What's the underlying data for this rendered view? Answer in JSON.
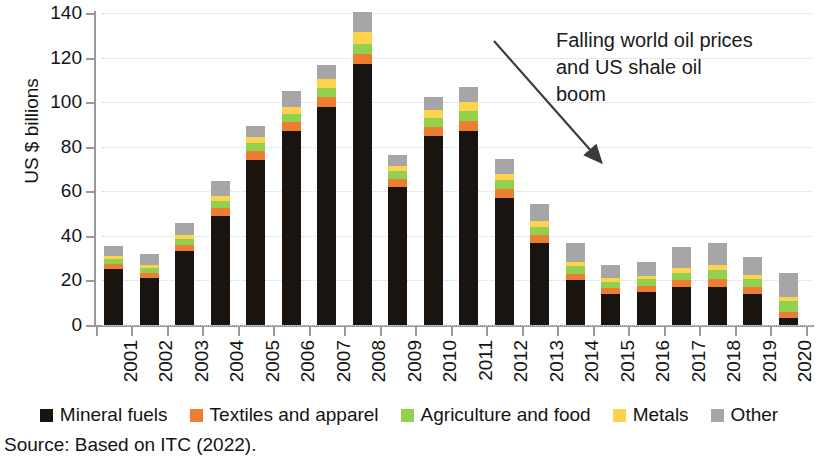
{
  "chart_data": {
    "type": "bar",
    "stacked": true,
    "title": "",
    "subtitle": "",
    "xlabel": "",
    "ylabel": "US $ billions",
    "ylim": [
      0,
      140
    ],
    "ytick_step": 20,
    "yticks": [
      "0",
      "20",
      "40",
      "60",
      "80",
      "100",
      "120",
      "140"
    ],
    "grid": true,
    "legend_position": "bottom",
    "categories": [
      "2001",
      "2002",
      "2003",
      "2004",
      "2005",
      "2006",
      "2007",
      "2008",
      "2009",
      "2010",
      "2011",
      "2012",
      "2013",
      "2014",
      "2015",
      "2016",
      "2017",
      "2018",
      "2019",
      "2020"
    ],
    "series": [
      {
        "name": "Mineral fuels",
        "color": "#1a1410",
        "values": [
          25,
          21,
          33,
          49,
          74,
          87,
          98,
          117,
          62,
          85,
          87,
          57,
          37,
          20,
          14,
          15,
          17,
          17,
          14,
          3
        ]
      },
      {
        "name": "Textiles and apparel",
        "color": "#ED7D31",
        "values": [
          2.5,
          2.5,
          3,
          3.5,
          4,
          4,
          4.5,
          4.5,
          3.5,
          4,
          4.5,
          4,
          3.5,
          3,
          2.5,
          2.5,
          3,
          3.5,
          3,
          3
        ]
      },
      {
        "name": "Agriculture and food",
        "color": "#92D050",
        "values": [
          2,
          2,
          2.5,
          3,
          3.5,
          3.5,
          4,
          4.5,
          3.5,
          4,
          4.5,
          4,
          3.5,
          3.5,
          3,
          3,
          3.5,
          4,
          3.5,
          5
        ]
      },
      {
        "name": "Metals",
        "color": "#FFD24D",
        "values": [
          1.5,
          1.5,
          2,
          2.5,
          3,
          3.5,
          4,
          5.5,
          2.5,
          3.5,
          4,
          3,
          2.5,
          2,
          1.5,
          1.5,
          2,
          2.5,
          2,
          1.5
        ]
      },
      {
        "name": "Other",
        "color": "#A6A6A6",
        "values": [
          4.5,
          5,
          5.5,
          6.5,
          5,
          7,
          6,
          9,
          5,
          6,
          7,
          6.5,
          8,
          8.5,
          6,
          6.5,
          9.5,
          10,
          8,
          11
        ]
      }
    ],
    "totals": [
      35.5,
      32,
      46,
      64.5,
      89.5,
      105,
      116.5,
      140.5,
      76.5,
      102.5,
      107,
      74.5,
      54.5,
      37,
      27,
      28.5,
      35,
      37,
      30.5,
      23.5
    ],
    "annotation": {
      "text": "Falling world oil prices and US shale oil boom",
      "lines": [
        "Falling world oil prices",
        "and US shale oil",
        "boom"
      ],
      "arrow_from_year": "2012",
      "arrow_to_year": "2015"
    }
  },
  "axis": {
    "y_title": "US $ billions",
    "y_ticks": [
      "140",
      "120",
      "100",
      "80",
      "60",
      "40",
      "20",
      "0"
    ],
    "x_ticks": [
      "2001",
      "2002",
      "2003",
      "2004",
      "2005",
      "2006",
      "2007",
      "2008",
      "2009",
      "2010",
      "2011",
      "2012",
      "2013",
      "2014",
      "2015",
      "2016",
      "2017",
      "2018",
      "2019",
      "2020"
    ]
  },
  "legend": {
    "items": [
      {
        "label": "Mineral fuels",
        "color": "#1a1410"
      },
      {
        "label": "Textiles and apparel",
        "color": "#ED7D31"
      },
      {
        "label": "Agriculture and food",
        "color": "#92D050"
      },
      {
        "label": "Metals",
        "color": "#FFD24D"
      },
      {
        "label": "Other",
        "color": "#A6A6A6"
      }
    ]
  },
  "annotation": {
    "line1": "Falling world oil prices",
    "line2": "and US shale oil",
    "line3": "boom"
  },
  "source": {
    "note": "Source: Based on ITC (2022)."
  }
}
